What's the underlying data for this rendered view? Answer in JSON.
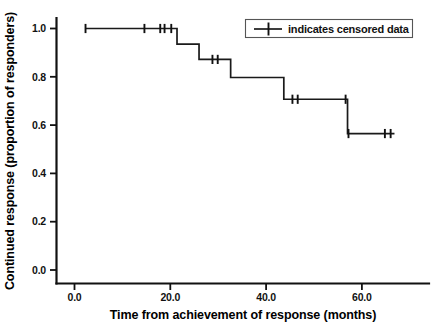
{
  "chart_data": {
    "type": "line",
    "subtype": "kaplan-meier-step",
    "title": "",
    "xlabel": "Time from achievement of response (months)",
    "ylabel": "Continued response (proportion of responders)",
    "xlim": [
      -3.0,
      74.5
    ],
    "ylim": [
      -0.04,
      1.06
    ],
    "grid": false,
    "xticks": [
      0.0,
      20.0,
      40.0,
      60.0
    ],
    "xticklabels": [
      "0.0",
      "20.0",
      "40.0",
      "60.0"
    ],
    "yticks": [
      0.0,
      0.2,
      0.4,
      0.6,
      0.8,
      1.0
    ],
    "yticklabels": [
      "0.0",
      "0.2",
      "0.4",
      "0.6",
      "0.8",
      "1.0"
    ],
    "series": [
      {
        "name": "Continued response",
        "step_points": [
          {
            "x": 2.3,
            "y": 1.0
          },
          {
            "x": 21.4,
            "y": 1.0
          },
          {
            "x": 21.4,
            "y": 0.935
          },
          {
            "x": 26.0,
            "y": 0.935
          },
          {
            "x": 26.0,
            "y": 0.872
          },
          {
            "x": 32.6,
            "y": 0.872
          },
          {
            "x": 32.6,
            "y": 0.797
          },
          {
            "x": 43.7,
            "y": 0.797
          },
          {
            "x": 43.7,
            "y": 0.707
          },
          {
            "x": 57.0,
            "y": 0.707
          },
          {
            "x": 57.0,
            "y": 0.565
          },
          {
            "x": 66.8,
            "y": 0.565
          }
        ],
        "censored_points": [
          {
            "x": 2.3,
            "y": 1.0
          },
          {
            "x": 14.6,
            "y": 1.0
          },
          {
            "x": 17.9,
            "y": 1.0
          },
          {
            "x": 18.8,
            "y": 1.0
          },
          {
            "x": 20.2,
            "y": 1.0
          },
          {
            "x": 28.8,
            "y": 0.872
          },
          {
            "x": 29.9,
            "y": 0.872
          },
          {
            "x": 45.5,
            "y": 0.707
          },
          {
            "x": 46.6,
            "y": 0.707
          },
          {
            "x": 56.6,
            "y": 0.707
          },
          {
            "x": 57.2,
            "y": 0.565
          },
          {
            "x": 64.8,
            "y": 0.565
          },
          {
            "x": 66.0,
            "y": 0.565
          }
        ]
      }
    ]
  },
  "legend": {
    "position": "top-right",
    "entries": [
      {
        "marker": "plus-censor-marker",
        "label": "indicates censored data"
      }
    ]
  },
  "colors": {
    "curve": "#1a1a1a",
    "axis": "#111111",
    "legend_border": "#555555",
    "background": "#ffffff"
  }
}
